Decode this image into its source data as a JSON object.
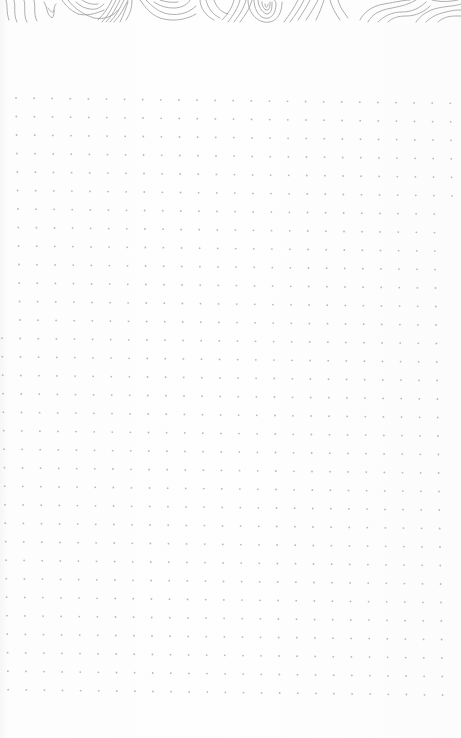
{
  "page": {
    "type": "dot-grid notebook page",
    "background_color": "#fdfdfd",
    "header_pattern": "topographic-contour-lines",
    "header_line_color": "#9a9a9a"
  },
  "dot_grid": {
    "dot_color": "#b8b8b8",
    "columns": 24,
    "rows": 33,
    "spacing_x": 18.1,
    "spacing_y": 18.5,
    "origin_x": 16,
    "origin_y": 98,
    "rotation_deg": -1.0
  }
}
